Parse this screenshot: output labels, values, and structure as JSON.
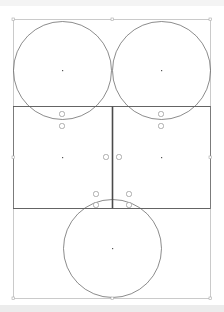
{
  "canvas": {
    "width": 224,
    "height": 312,
    "background": "#ffffff",
    "frame_color": "#bdbdbd",
    "line_color": "#5a5a5a",
    "divider_color": "#4a4a4a",
    "marker_color": "#9a9a9a",
    "handle_color": "#a8a8a8"
  },
  "frame": {
    "x": 13,
    "y": 19,
    "width": 197,
    "height": 279
  },
  "circles": [
    {
      "id": "top-left-circle",
      "cx": 62,
      "cy": 70,
      "r": 49
    },
    {
      "id": "top-right-circle",
      "cx": 161,
      "cy": 70,
      "r": 49
    },
    {
      "id": "bottom-circle",
      "cx": 112,
      "cy": 248,
      "r": 49
    }
  ],
  "rectangles": [
    {
      "id": "middle-left-rect",
      "x": 13,
      "y": 106,
      "width": 99,
      "height": 102
    },
    {
      "id": "middle-right-rect",
      "x": 112,
      "y": 106,
      "width": 98,
      "height": 102
    }
  ],
  "center_points": [
    {
      "x": 62,
      "y": 70
    },
    {
      "x": 161,
      "y": 70
    },
    {
      "x": 62,
      "y": 157
    },
    {
      "x": 161,
      "y": 157
    },
    {
      "x": 112,
      "y": 248
    }
  ],
  "connection_markers": [
    {
      "x": 62,
      "y": 114
    },
    {
      "x": 62,
      "y": 126
    },
    {
      "x": 161,
      "y": 114
    },
    {
      "x": 161,
      "y": 126
    },
    {
      "x": 106,
      "y": 157
    },
    {
      "x": 119,
      "y": 157
    },
    {
      "x": 96,
      "y": 194
    },
    {
      "x": 96,
      "y": 205
    },
    {
      "x": 129,
      "y": 194
    },
    {
      "x": 129,
      "y": 205
    }
  ],
  "selection_handles": [
    {
      "x": 13,
      "y": 19
    },
    {
      "x": 112,
      "y": 19
    },
    {
      "x": 210,
      "y": 19
    },
    {
      "x": 13,
      "y": 157
    },
    {
      "x": 210,
      "y": 157
    },
    {
      "x": 13,
      "y": 298
    },
    {
      "x": 112,
      "y": 298
    },
    {
      "x": 210,
      "y": 298
    }
  ]
}
